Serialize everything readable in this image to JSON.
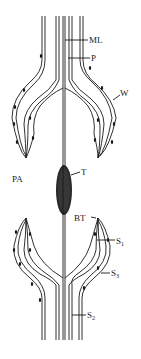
{
  "diagram": {
    "type": "anatomical-schematic",
    "labels": {
      "ML": "ML",
      "P": "P",
      "W": "W",
      "PA": "PA",
      "T": "T",
      "BT": "BT",
      "S1": "S",
      "S1_sub": "1",
      "S3": "S",
      "S3_sub": "3",
      "S2": "S",
      "S2_sub": "2"
    },
    "colors": {
      "line": "#1a1a1a",
      "background": "#ffffff"
    }
  }
}
